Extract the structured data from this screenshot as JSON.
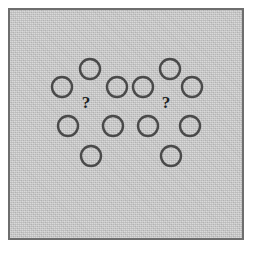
{
  "figure": {
    "background_color": "#ffffff",
    "panel": {
      "name": "stimulus panel",
      "fill_color": "#c9c9c9",
      "border_color": "#6e6e6e",
      "border_width": 2,
      "x": 8,
      "y": 8,
      "width": 236,
      "height": 232,
      "texture": "fine noise / grain"
    },
    "circle_style": {
      "stroke_color": "#4a4a4a",
      "stroke_width": 2.4,
      "fill": "none",
      "radius": 10
    },
    "label_style": {
      "color": "#1f1f1f",
      "font_size": 17
    },
    "clusters": [
      {
        "id": "left-cluster",
        "name": "left circle cluster",
        "probe_label": "?",
        "probe_x": 86,
        "probe_y": 104,
        "circle_count": 6,
        "circles": [
          {
            "index": 0,
            "position": "top",
            "cx": 90,
            "cy": 69,
            "r": 10
          },
          {
            "index": 1,
            "position": "upper-left",
            "cx": 62,
            "cy": 87,
            "r": 10
          },
          {
            "index": 2,
            "position": "upper-right",
            "cx": 117,
            "cy": 87,
            "r": 10
          },
          {
            "index": 3,
            "position": "lower-left",
            "cx": 68,
            "cy": 126,
            "r": 10
          },
          {
            "index": 4,
            "position": "lower-right",
            "cx": 113,
            "cy": 126,
            "r": 10
          },
          {
            "index": 5,
            "position": "bottom",
            "cx": 91,
            "cy": 156,
            "r": 10
          }
        ]
      },
      {
        "id": "right-cluster",
        "name": "right circle cluster",
        "probe_label": "?",
        "probe_x": 166,
        "probe_y": 104,
        "circle_count": 6,
        "circles": [
          {
            "index": 0,
            "position": "top",
            "cx": 170,
            "cy": 69,
            "r": 10
          },
          {
            "index": 1,
            "position": "upper-left",
            "cx": 143,
            "cy": 87,
            "r": 10
          },
          {
            "index": 2,
            "position": "upper-right",
            "cx": 192,
            "cy": 87,
            "r": 10
          },
          {
            "index": 3,
            "position": "lower-left",
            "cx": 148,
            "cy": 126,
            "r": 10
          },
          {
            "index": 4,
            "position": "lower-right",
            "cx": 190,
            "cy": 126,
            "r": 10
          },
          {
            "index": 5,
            "position": "bottom",
            "cx": 171,
            "cy": 156,
            "r": 10
          }
        ]
      }
    ]
  }
}
